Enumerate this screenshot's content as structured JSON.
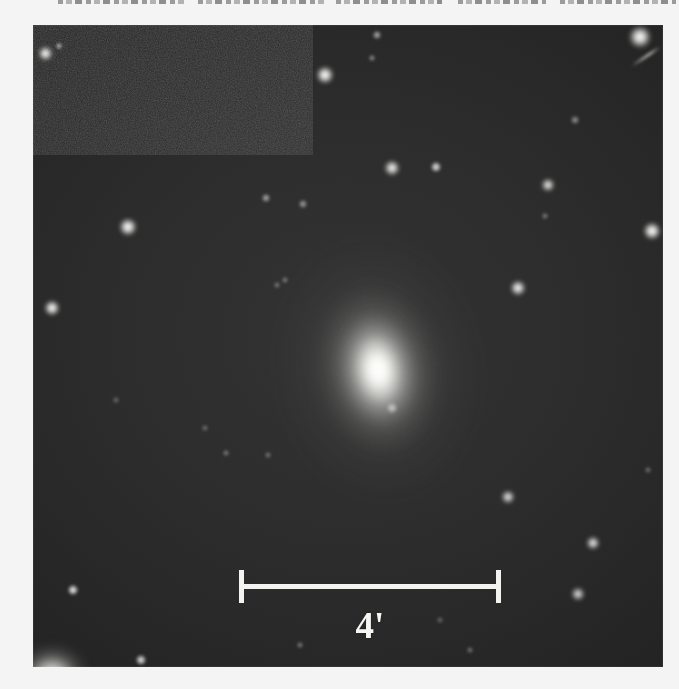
{
  "figure": {
    "kind": "astronomical-plate-image",
    "caption_sliver_visible": true,
    "plate": {
      "x": 33,
      "y": 25,
      "width": 630,
      "height": 642,
      "background_color": "#2b2b2b",
      "star_color": "#ffffff"
    },
    "scalebar": {
      "label": "4'",
      "unit": "arcminutes",
      "value": 4,
      "bar_x_start": 206,
      "bar_x_end": 468,
      "bar_y": 561,
      "length_px": 262,
      "color": "#f3f3f0"
    },
    "galaxy": {
      "name": "",
      "center_x": 345,
      "center_y": 345,
      "morphology": "elliptical-lenticular",
      "position_angle_deg": -9,
      "core_color": "#ffffff",
      "halo_width_px": 210,
      "halo_height_px": 270
    },
    "stars": [
      {
        "x": 45,
        "y": 53,
        "r": 5.0,
        "b": 1.0
      },
      {
        "x": 59,
        "y": 46,
        "r": 2.6,
        "b": 0.72
      },
      {
        "x": 325,
        "y": 75,
        "r": 6.2,
        "b": 1.0
      },
      {
        "x": 640,
        "y": 37,
        "r": 7.4,
        "b": 1.0
      },
      {
        "x": 377,
        "y": 35,
        "r": 3.0,
        "b": 0.6
      },
      {
        "x": 372,
        "y": 58,
        "r": 2.6,
        "b": 0.5
      },
      {
        "x": 128,
        "y": 227,
        "r": 5.8,
        "b": 1.0
      },
      {
        "x": 392,
        "y": 168,
        "r": 5.2,
        "b": 0.96
      },
      {
        "x": 436,
        "y": 167,
        "r": 4.2,
        "b": 0.82
      },
      {
        "x": 266,
        "y": 198,
        "r": 3.2,
        "b": 0.58
      },
      {
        "x": 303,
        "y": 204,
        "r": 2.8,
        "b": 0.52
      },
      {
        "x": 548,
        "y": 185,
        "r": 4.8,
        "b": 0.92
      },
      {
        "x": 575,
        "y": 120,
        "r": 2.8,
        "b": 0.48
      },
      {
        "x": 652,
        "y": 231,
        "r": 6.4,
        "b": 1.0
      },
      {
        "x": 518,
        "y": 288,
        "r": 5.4,
        "b": 0.96
      },
      {
        "x": 545,
        "y": 216,
        "r": 2.6,
        "b": 0.42
      },
      {
        "x": 285,
        "y": 280,
        "r": 2.4,
        "b": 0.4
      },
      {
        "x": 52,
        "y": 308,
        "r": 5.4,
        "b": 1.0
      },
      {
        "x": 277,
        "y": 285,
        "r": 2.2,
        "b": 0.38
      },
      {
        "x": 392,
        "y": 408,
        "r": 3.6,
        "b": 0.74
      },
      {
        "x": 508,
        "y": 497,
        "r": 4.6,
        "b": 0.9
      },
      {
        "x": 593,
        "y": 543,
        "r": 4.8,
        "b": 0.92
      },
      {
        "x": 578,
        "y": 594,
        "r": 4.4,
        "b": 0.86
      },
      {
        "x": 73,
        "y": 590,
        "r": 4.2,
        "b": 0.88
      },
      {
        "x": 141,
        "y": 660,
        "r": 4.0,
        "b": 0.82
      },
      {
        "x": 226,
        "y": 453,
        "r": 2.4,
        "b": 0.4
      },
      {
        "x": 268,
        "y": 455,
        "r": 2.2,
        "b": 0.36
      },
      {
        "x": 205,
        "y": 428,
        "r": 2.2,
        "b": 0.34
      },
      {
        "x": 648,
        "y": 470,
        "r": 2.4,
        "b": 0.36
      },
      {
        "x": 300,
        "y": 645,
        "r": 2.6,
        "b": 0.42
      },
      {
        "x": 470,
        "y": 650,
        "r": 2.4,
        "b": 0.38
      },
      {
        "x": 116,
        "y": 400,
        "r": 2.2,
        "b": 0.32
      },
      {
        "x": 440,
        "y": 620,
        "r": 2.2,
        "b": 0.32
      }
    ],
    "text_sliver_lines": [
      {
        "x": 58,
        "w": 128
      },
      {
        "x": 198,
        "w": 126
      },
      {
        "x": 336,
        "w": 106
      },
      {
        "x": 458,
        "w": 88
      },
      {
        "x": 560,
        "w": 116
      }
    ]
  }
}
